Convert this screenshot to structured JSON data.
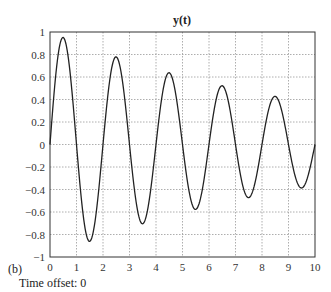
{
  "chart_data": {
    "type": "line",
    "title": "y(t)",
    "xlabel": "",
    "ylabel": "",
    "xlim": [
      0,
      10
    ],
    "ylim": [
      -1,
      1
    ],
    "grid": true,
    "x_ticks": [
      "0",
      "1",
      "2",
      "3",
      "4",
      "5",
      "6",
      "7",
      "8",
      "9",
      "10"
    ],
    "y_ticks": [
      "1",
      "0.8",
      "0.6",
      "0.4",
      "0.2",
      "0",
      "-0.2",
      "-0.4",
      "-0.6",
      "-0.8",
      "-1"
    ],
    "function": "y(t) = exp(-0.1 t) * sin(pi t)",
    "series": [
      {
        "name": "y(t)",
        "x": [
          0,
          0.5,
          1,
          1.5,
          2,
          2.5,
          3,
          3.5,
          4,
          4.5,
          5,
          5.5,
          6,
          6.5,
          7,
          7.5,
          8,
          8.5,
          9,
          9.5,
          10
        ],
        "values": [
          0,
          0.95,
          0,
          -0.86,
          0,
          0.78,
          0,
          -0.7,
          0,
          0.64,
          0,
          -0.58,
          0,
          0.52,
          0,
          -0.47,
          0,
          0.43,
          0,
          -0.39,
          0
        ]
      }
    ],
    "annotations": [
      "(b)",
      "Time offset: 0"
    ]
  },
  "figure": {
    "title": "y(t)",
    "panel_label": "(b)",
    "time_offset_label": "Time offset: 0"
  }
}
